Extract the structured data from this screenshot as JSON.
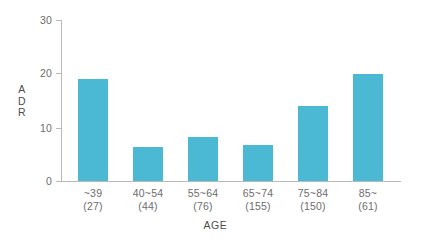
{
  "chart_data": {
    "type": "bar",
    "title": "",
    "xlabel": "AGE",
    "ylabel": "ADR",
    "ylim": [
      0,
      30
    ],
    "yticks": [
      "0",
      "10",
      "20",
      "30"
    ],
    "ytick_values": [
      0,
      10,
      20,
      30
    ],
    "grid": false,
    "legend": null,
    "bar_color": "#4bb8d4",
    "axis_color": "#b9b9b9",
    "text_color": "#6d6d6d",
    "categories": [
      "~39",
      "40~54",
      "55~64",
      "65~74",
      "75~84",
      "85~"
    ],
    "category_counts": [
      "(27)",
      "(44)",
      "(76)",
      "(155)",
      "(150)",
      "(61)"
    ],
    "values": [
      19.1,
      6.3,
      8.2,
      6.7,
      14.0,
      19.9
    ],
    "bars": [
      {
        "range": "~39",
        "count": "(27)",
        "value": 19.1
      },
      {
        "range": "40~54",
        "count": "(44)",
        "value": 6.3
      },
      {
        "range": "55~64",
        "count": "(76)",
        "value": 8.2
      },
      {
        "range": "65~74",
        "count": "(155)",
        "value": 6.7
      },
      {
        "range": "75~84",
        "count": "(150)",
        "value": 14.0
      },
      {
        "range": "85~",
        "count": "(61)",
        "value": 19.9
      }
    ]
  },
  "axis": {
    "y_title_lines": [
      "A",
      "D",
      "R"
    ],
    "x_title": "AGE"
  }
}
